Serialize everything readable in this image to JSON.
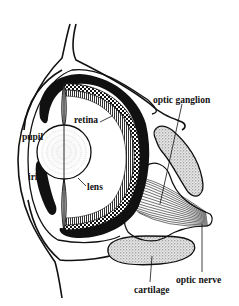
{
  "diagram": {
    "labels": {
      "pupil": "pupil",
      "retina": "retina",
      "iris": "iris",
      "lens": "lens",
      "optic_ganglion": "optic ganglion",
      "optic_nerve": "optic nerve",
      "cartilage": "cartilage"
    },
    "colors": {
      "ink": "#111111",
      "background": "#ffffff",
      "stipple": "#9a9a9a"
    }
  }
}
